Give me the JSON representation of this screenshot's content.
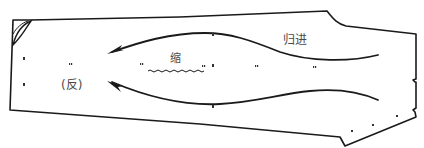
{
  "diagram": {
    "type": "garment-pattern-piece",
    "piece": "trouser leg (front)",
    "labels": {
      "ease_in": "归进",
      "shrink": "缩",
      "reverse_side": "(反)"
    },
    "colors": {
      "outline": "#1a1a1a",
      "text": "#4a4a4a",
      "background": "#ffffff"
    },
    "annotations": [
      {
        "id": "upper-arrow",
        "direction": "right-to-left",
        "meaning": "push fullness toward left"
      },
      {
        "id": "lower-arrow",
        "direction": "right-to-left",
        "meaning": "push fullness toward left"
      },
      {
        "id": "wavy-shrink-line",
        "meaning": "shrink/ease area"
      }
    ]
  }
}
